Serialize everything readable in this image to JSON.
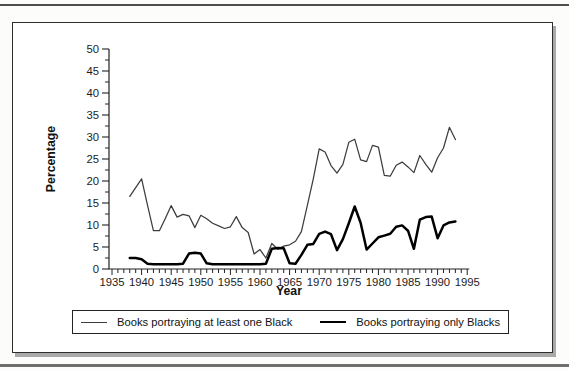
{
  "chart_data": {
    "type": "line",
    "title": "",
    "xlabel": "Year",
    "ylabel": "Percentage",
    "xlim": [
      1935,
      1995
    ],
    "ylim": [
      0,
      50
    ],
    "x_ticks": [
      1935,
      1940,
      1945,
      1950,
      1955,
      1960,
      1965,
      1970,
      1975,
      1980,
      1985,
      1990,
      1995
    ],
    "y_ticks": [
      0,
      5,
      10,
      15,
      20,
      25,
      30,
      35,
      40,
      45,
      50
    ],
    "x_minor_step": 1,
    "y_minor_step": 2.5,
    "grid": false,
    "legend_position": "bottom",
    "x": [
      1938,
      1939,
      1940,
      1941,
      1942,
      1943,
      1944,
      1945,
      1946,
      1947,
      1948,
      1949,
      1950,
      1951,
      1952,
      1953,
      1954,
      1955,
      1956,
      1957,
      1958,
      1959,
      1960,
      1961,
      1962,
      1963,
      1964,
      1965,
      1966,
      1967,
      1968,
      1969,
      1970,
      1971,
      1972,
      1973,
      1974,
      1975,
      1976,
      1977,
      1978,
      1979,
      1980,
      1981,
      1982,
      1983,
      1984,
      1985,
      1986,
      1987,
      1988,
      1989,
      1990,
      1991,
      1992,
      1993
    ],
    "series": [
      {
        "name": "Books portraying at least one Black",
        "weight": "thin",
        "color": "#3d3d3d",
        "values": [
          16.5,
          18.5,
          20.5,
          14.5,
          8.7,
          8.7,
          11.5,
          14.4,
          11.8,
          12.4,
          12.1,
          9.4,
          12.2,
          11.4,
          10.4,
          9.8,
          9.2,
          9.6,
          11.9,
          9.4,
          8.3,
          3.4,
          4.4,
          2.5,
          5.8,
          4.5,
          5.2,
          5.5,
          6.3,
          8.5,
          14.5,
          20.5,
          27.3,
          26.6,
          23.5,
          21.8,
          23.8,
          28.8,
          29.5,
          24.8,
          24.4,
          28.1,
          27.7,
          21.3,
          21.1,
          23.6,
          24.3,
          23.2,
          21.9,
          25.8,
          23.8,
          22.0,
          25.3,
          27.5,
          32.2,
          29.4
        ]
      },
      {
        "name": "Books portraying only Blacks",
        "weight": "thick",
        "color": "#000000",
        "values": [
          2.5,
          2.5,
          2.2,
          1.2,
          1.1,
          1.1,
          1.1,
          1.1,
          1.1,
          1.2,
          3.5,
          3.7,
          3.5,
          1.3,
          1.1,
          1.1,
          1.1,
          1.1,
          1.1,
          1.1,
          1.1,
          1.1,
          1.1,
          1.2,
          4.6,
          4.8,
          4.7,
          1.3,
          1.2,
          3.2,
          5.5,
          5.7,
          8.0,
          8.5,
          7.9,
          4.3,
          6.8,
          10.4,
          14.2,
          10.5,
          4.4,
          5.8,
          7.2,
          7.6,
          8.0,
          9.6,
          9.9,
          8.7,
          4.6,
          11.2,
          11.8,
          11.9,
          7.0,
          9.9,
          10.6,
          10.8
        ]
      }
    ]
  }
}
